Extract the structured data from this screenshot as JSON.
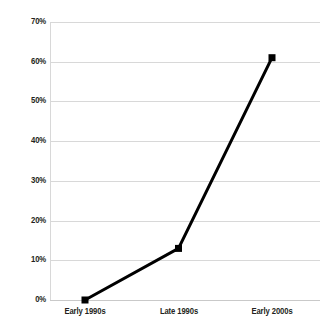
{
  "chart_data": {
    "type": "line",
    "title": "",
    "subtitle": "",
    "xlabel": "",
    "ylabel": "",
    "categories": [
      "Early 1990s",
      "Late 1990s",
      "Early 2000s"
    ],
    "series": [
      {
        "name": "",
        "values": [
          0,
          13,
          61
        ],
        "color": "#000000",
        "marker": "square"
      }
    ],
    "ylim": [
      0,
      70
    ],
    "ytick_values": [
      70,
      60,
      50,
      40,
      30,
      20,
      10,
      0
    ],
    "ytick_labels": [
      "70%",
      "60%",
      "50%",
      "40%",
      "30%",
      "20%",
      "10%",
      "0%"
    ],
    "grid": true,
    "grid_color": "#d8d8d8",
    "legend": false,
    "legend_position": "none",
    "background_color": "#ffffff",
    "text_color": "#231f20"
  }
}
